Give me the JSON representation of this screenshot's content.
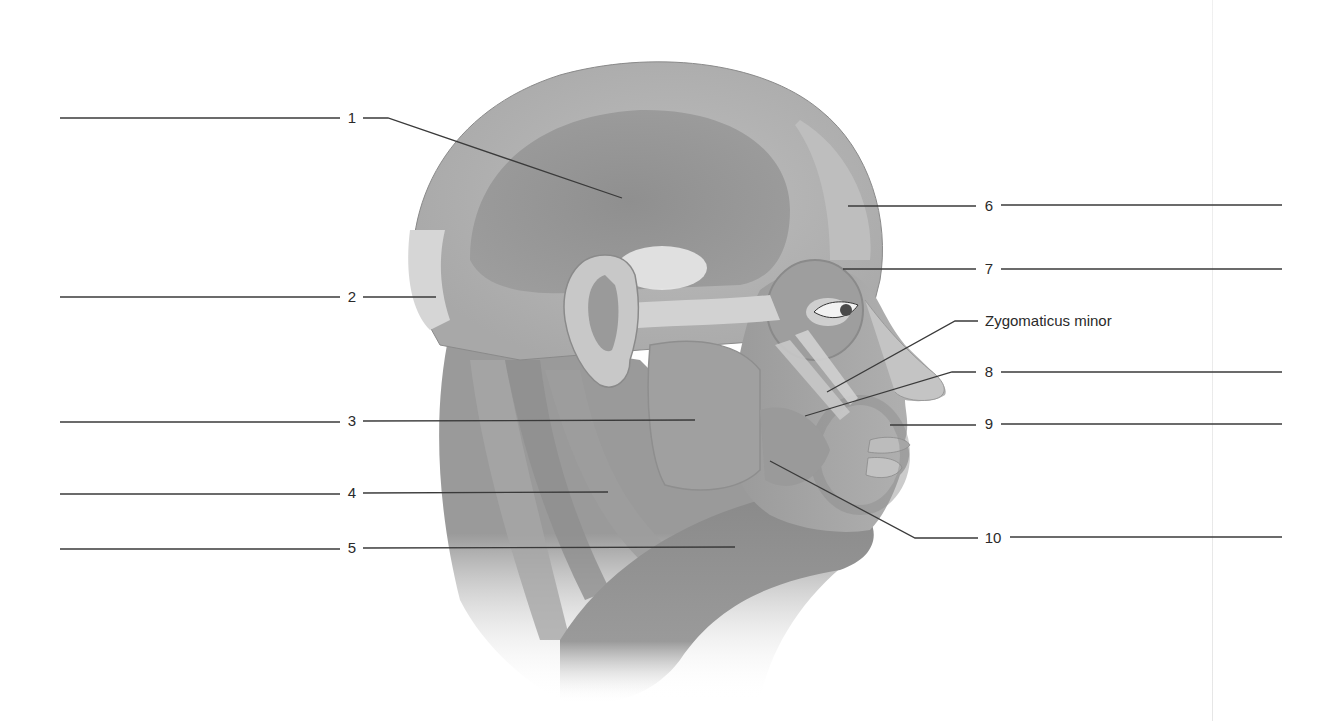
{
  "diagram": {
    "background_color": "#ffffff",
    "line_color": "#3a3a3a",
    "text_color": "#2a2a2a"
  },
  "labels": [
    {
      "id": "1",
      "text": "1",
      "x": 352,
      "y": 118,
      "side": "left",
      "blank": [
        60,
        118,
        340,
        118
      ],
      "leader": [
        [
          363,
          118
        ],
        [
          388,
          118
        ],
        [
          622,
          198
        ]
      ]
    },
    {
      "id": "2",
      "text": "2",
      "x": 352,
      "y": 297,
      "side": "left",
      "blank": [
        60,
        297,
        340,
        297
      ],
      "leader": [
        [
          363,
          297
        ],
        [
          436,
          297
        ]
      ]
    },
    {
      "id": "3",
      "text": "3",
      "x": 352,
      "y": 421,
      "side": "left",
      "blank": [
        60,
        422,
        340,
        422
      ],
      "leader": [
        [
          363,
          421
        ],
        [
          695,
          420
        ]
      ]
    },
    {
      "id": "4",
      "text": "4",
      "x": 352,
      "y": 493,
      "side": "left",
      "blank": [
        60,
        494,
        340,
        494
      ],
      "leader": [
        [
          363,
          493
        ],
        [
          608,
          492
        ]
      ]
    },
    {
      "id": "5",
      "text": "5",
      "x": 352,
      "y": 548,
      "side": "left",
      "blank": [
        60,
        549,
        340,
        549
      ],
      "leader": [
        [
          363,
          548
        ],
        [
          735,
          547
        ]
      ]
    },
    {
      "id": "6",
      "text": "6",
      "x": 989,
      "y": 206,
      "side": "right",
      "blank": [
        1001,
        205,
        1282,
        205
      ],
      "leader": [
        [
          848,
          206
        ],
        [
          976,
          206
        ]
      ]
    },
    {
      "id": "7",
      "text": "7",
      "x": 989,
      "y": 269,
      "side": "right",
      "blank": [
        1001,
        269,
        1282,
        269
      ],
      "leader": [
        [
          843,
          269
        ],
        [
          976,
          269
        ]
      ]
    },
    {
      "id": "zm",
      "text": "Zygomaticus minor",
      "x": 985,
      "y": 321,
      "side": "right",
      "blank": null,
      "leader": [
        [
          827,
          392
        ],
        [
          955,
          321
        ],
        [
          978,
          321
        ]
      ]
    },
    {
      "id": "8",
      "text": "8",
      "x": 989,
      "y": 372,
      "side": "right",
      "blank": [
        1001,
        372,
        1282,
        372
      ],
      "leader": [
        [
          805,
          416
        ],
        [
          952,
          372
        ],
        [
          976,
          372
        ]
      ]
    },
    {
      "id": "9",
      "text": "9",
      "x": 989,
      "y": 424,
      "side": "right",
      "blank": [
        1001,
        424,
        1282,
        424
      ],
      "leader": [
        [
          890,
          425
        ],
        [
          976,
          425
        ]
      ]
    },
    {
      "id": "10",
      "text": "10",
      "x": 993,
      "y": 538,
      "side": "right",
      "blank": [
        1010,
        537,
        1282,
        537
      ],
      "leader": [
        [
          770,
          461
        ],
        [
          915,
          538
        ],
        [
          978,
          538
        ]
      ]
    }
  ]
}
